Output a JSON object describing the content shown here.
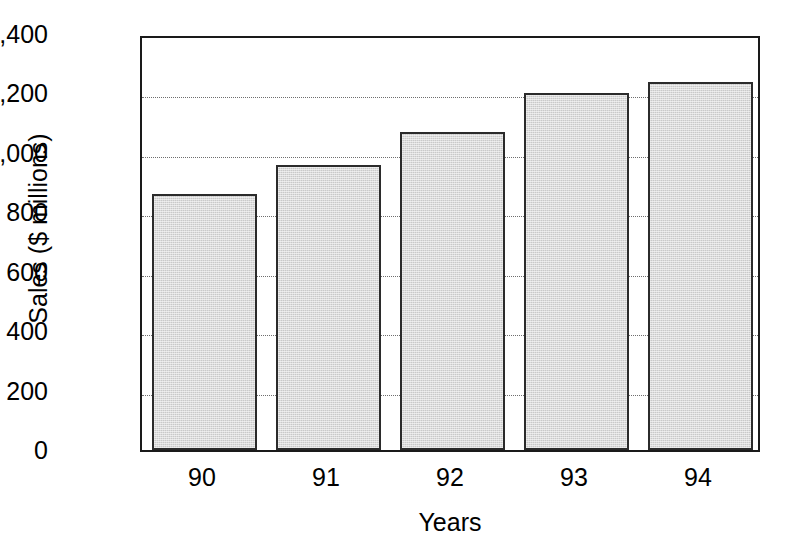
{
  "chart_data": {
    "type": "bar",
    "title": "",
    "xlabel": "Years",
    "ylabel": "Sales ($ millions)",
    "categories": [
      "90",
      "91",
      "92",
      "93",
      "94"
    ],
    "values": [
      860,
      960,
      1070,
      1200,
      1240
    ],
    "series": [
      {
        "name": "Sales",
        "values": [
          860,
          960,
          1070,
          1200,
          1240
        ]
      }
    ],
    "ylim": [
      0,
      1400
    ],
    "y_ticks": [
      0,
      200,
      400,
      600,
      800,
      1000,
      1200,
      1400
    ],
    "y_tick_labels": [
      "0",
      "200",
      "400",
      "600",
      "800",
      "1,000",
      "1,200",
      "1,400"
    ],
    "x_tick_labels": [
      "90",
      "91",
      "92",
      "93",
      "94"
    ],
    "grid": "horizontal-dotted",
    "legend": "none",
    "bar_fill_color": "#c9c9c9",
    "bar_border_color": "#2b2b2b",
    "axis_color": "#1a1a1a",
    "gridline_color": "#6e6e6e",
    "background_color": "#ffffff"
  }
}
